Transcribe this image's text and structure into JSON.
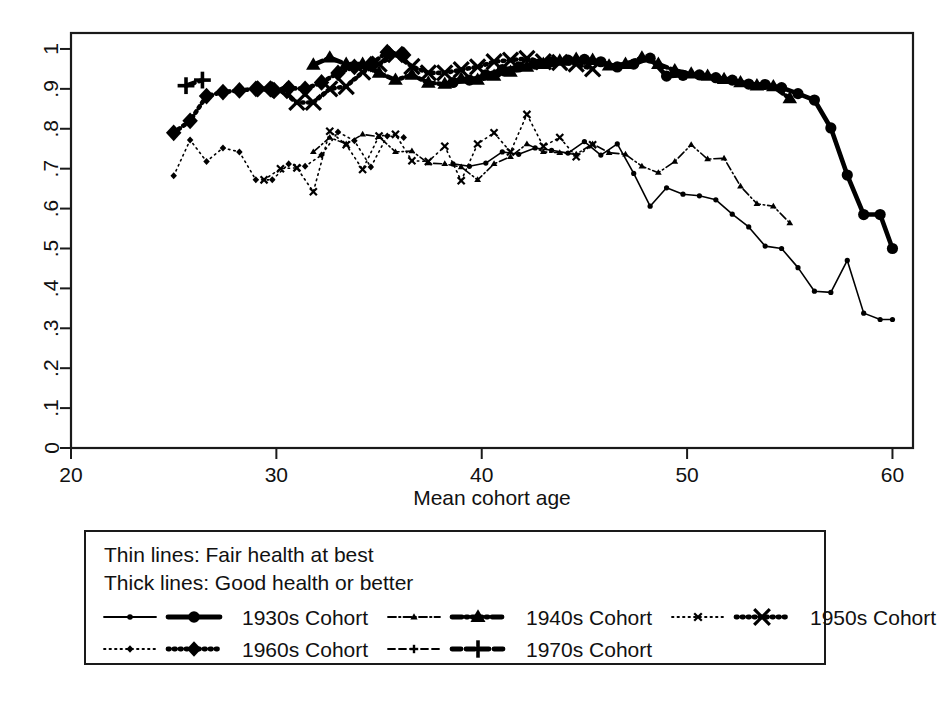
{
  "chart_data": {
    "type": "line",
    "title": "",
    "xlabel": "Mean cohort age",
    "ylabel": "",
    "xlim": [
      20,
      61
    ],
    "ylim": [
      0,
      1.04
    ],
    "xticks": [
      20,
      30,
      40,
      50,
      60
    ],
    "xticklabels": [
      "20",
      "30",
      "40",
      "50",
      "60"
    ],
    "yticks": [
      0,
      0.1,
      0.2,
      0.3,
      0.4,
      0.5,
      0.6,
      0.7,
      0.8,
      0.9,
      1
    ],
    "yticklabels": [
      "0",
      ".1",
      ".2",
      ".3",
      ".4",
      ".5",
      ".6",
      ".7",
      ".8",
      ".9",
      "1"
    ],
    "grid": false,
    "legend_position": "below-axes",
    "legend_notes": [
      "Thin lines: Fair health at best",
      "Thick lines: Good health or better"
    ],
    "series": [
      {
        "name": "1930s Cohort",
        "label": "1930s Cohort",
        "weight": "thick",
        "health": "Good health or better",
        "marker": "circle",
        "dash": "solid",
        "x": [
          38.6,
          39.4,
          40.2,
          41.0,
          41.8,
          42.6,
          43.4,
          44.2,
          45.0,
          45.8,
          46.6,
          47.4,
          48.2,
          49.0,
          49.8,
          50.6,
          51.4,
          52.2,
          53.0,
          53.8,
          54.6,
          55.4,
          56.2,
          57.0,
          57.8,
          58.6,
          59.4,
          60.0
        ],
        "y": [
          0.916,
          0.922,
          0.935,
          0.948,
          0.955,
          0.962,
          0.968,
          0.972,
          0.974,
          0.968,
          0.955,
          0.962,
          0.977,
          0.932,
          0.934,
          0.935,
          0.928,
          0.922,
          0.912,
          0.911,
          0.903,
          0.888,
          0.872,
          0.802,
          0.684,
          0.585,
          0.585,
          0.5
        ]
      },
      {
        "name": "1930s Cohort",
        "label": "1930s Cohort",
        "weight": "thin",
        "health": "Fair health at best",
        "marker": "circle",
        "dash": "solid",
        "x": [
          38.6,
          39.4,
          40.2,
          41.0,
          41.8,
          42.6,
          43.4,
          44.2,
          45.0,
          45.8,
          46.6,
          47.4,
          48.2,
          49.0,
          49.8,
          50.6,
          51.4,
          52.2,
          53.0,
          53.8,
          54.6,
          55.4,
          56.2,
          57.0,
          57.8,
          58.6,
          59.4,
          60.0
        ],
        "y": [
          0.712,
          0.706,
          0.714,
          0.742,
          0.736,
          0.752,
          0.746,
          0.739,
          0.768,
          0.734,
          0.762,
          0.688,
          0.606,
          0.652,
          0.636,
          0.632,
          0.622,
          0.586,
          0.554,
          0.506,
          0.5,
          0.452,
          0.393,
          0.39,
          0.47,
          0.338,
          0.322,
          0.322
        ]
      },
      {
        "name": "1940s Cohort",
        "label": "1940s Cohort",
        "weight": "thick",
        "health": "Good health or better",
        "marker": "triangle",
        "dash": "dashdot",
        "x": [
          31.8,
          32.6,
          33.4,
          34.2,
          35.0,
          35.8,
          36.6,
          37.4,
          38.2,
          39.0,
          39.8,
          40.6,
          41.4,
          42.2,
          43.0,
          43.8,
          44.6,
          45.4,
          46.2,
          47.0,
          47.8,
          48.6,
          49.4,
          50.2,
          51.0,
          51.8,
          52.6,
          53.4,
          54.2,
          55.0
        ],
        "y": [
          0.96,
          0.978,
          0.962,
          0.962,
          0.94,
          0.922,
          0.935,
          0.915,
          0.912,
          0.925,
          0.922,
          0.932,
          0.942,
          0.955,
          0.962,
          0.97,
          0.975,
          0.972,
          0.958,
          0.962,
          0.978,
          0.962,
          0.946,
          0.938,
          0.932,
          0.924,
          0.916,
          0.908,
          0.906,
          0.876
        ]
      },
      {
        "name": "1940s Cohort",
        "label": "1940s Cohort",
        "weight": "thin",
        "health": "Fair health at best",
        "marker": "triangle",
        "dash": "dashdot",
        "x": [
          31.8,
          32.6,
          33.4,
          34.2,
          35.0,
          35.8,
          36.6,
          37.4,
          38.2,
          39.0,
          39.8,
          40.6,
          41.4,
          42.2,
          43.0,
          43.8,
          44.6,
          45.4,
          46.2,
          47.0,
          47.8,
          48.6,
          49.4,
          50.2,
          51.0,
          51.8,
          52.6,
          53.4,
          54.2,
          55.0
        ],
        "y": [
          0.742,
          0.778,
          0.762,
          0.786,
          0.78,
          0.742,
          0.744,
          0.714,
          0.712,
          0.704,
          0.672,
          0.712,
          0.73,
          0.762,
          0.742,
          0.74,
          0.736,
          0.762,
          0.74,
          0.736,
          0.706,
          0.69,
          0.718,
          0.76,
          0.724,
          0.726,
          0.656,
          0.612,
          0.606,
          0.564
        ]
      },
      {
        "name": "1950s Cohort",
        "label": "1950s Cohort",
        "weight": "thick",
        "health": "Good health or better",
        "marker": "x",
        "dash": "dotted",
        "x": [
          29.4,
          30.2,
          31.0,
          31.8,
          32.6,
          33.4,
          34.2,
          35.0,
          35.8,
          36.6,
          37.4,
          38.2,
          39.0,
          39.8,
          40.6,
          41.4,
          42.2,
          43.0,
          43.8,
          44.6,
          45.4
        ],
        "y": [
          0.9,
          0.896,
          0.866,
          0.866,
          0.9,
          0.906,
          0.942,
          0.962,
          0.986,
          0.956,
          0.94,
          0.94,
          0.948,
          0.955,
          0.968,
          0.972,
          0.976,
          0.968,
          0.966,
          0.962,
          0.95
        ]
      },
      {
        "name": "1950s Cohort",
        "label": "1950s Cohort",
        "weight": "thin",
        "health": "Fair health at best",
        "marker": "x",
        "dash": "dotted",
        "x": [
          29.4,
          30.2,
          31.0,
          31.8,
          32.6,
          33.4,
          34.2,
          35.0,
          35.8,
          36.6,
          37.4,
          38.2,
          39.0,
          39.8,
          40.6,
          41.4,
          42.2,
          43.0,
          43.8,
          44.6,
          45.4
        ],
        "y": [
          0.672,
          0.7,
          0.702,
          0.642,
          0.794,
          0.76,
          0.698,
          0.782,
          0.786,
          0.72,
          0.718,
          0.756,
          0.67,
          0.762,
          0.79,
          0.742,
          0.836,
          0.756,
          0.778,
          0.73,
          0.76
        ]
      },
      {
        "name": "1960s Cohort",
        "label": "1960s Cohort",
        "weight": "thick",
        "health": "Good health or better",
        "marker": "diamond",
        "dash": "dotted",
        "x": [
          25.0,
          25.8,
          26.6,
          27.4,
          28.2,
          29.0,
          29.8,
          30.6,
          31.4,
          32.2,
          33.0,
          33.8,
          34.6,
          35.4,
          36.2
        ],
        "y": [
          0.79,
          0.82,
          0.882,
          0.892,
          0.896,
          0.9,
          0.898,
          0.902,
          0.9,
          0.916,
          0.94,
          0.955,
          0.962,
          0.992,
          0.985
        ]
      },
      {
        "name": "1960s Cohort",
        "label": "1960s Cohort",
        "weight": "thin",
        "health": "Fair health at best",
        "marker": "diamond",
        "dash": "dotted",
        "x": [
          25.0,
          25.8,
          26.6,
          27.4,
          28.2,
          29.0,
          29.8,
          30.6,
          31.4,
          32.2,
          33.0,
          33.8,
          34.6,
          35.4,
          36.2
        ],
        "y": [
          0.682,
          0.772,
          0.718,
          0.752,
          0.742,
          0.672,
          0.672,
          0.712,
          0.706,
          0.734,
          0.792,
          0.77,
          0.704,
          0.782,
          0.778
        ]
      },
      {
        "name": "1970s Cohort",
        "label": "1970s Cohort",
        "weight": "thick",
        "health": "Good health or better",
        "marker": "plus",
        "dash": "dashed",
        "x": [
          25.6,
          26.4
        ],
        "y": [
          0.908,
          0.922
        ]
      }
    ]
  },
  "axes": {
    "xlabel": "Mean cohort age",
    "xticklabels": [
      "20",
      "30",
      "40",
      "50",
      "60"
    ],
    "yticklabels": [
      "0",
      ".1",
      ".2",
      ".3",
      ".4",
      ".5",
      ".6",
      ".7",
      ".8",
      ".9",
      "1"
    ]
  },
  "legend": {
    "note_thin": "Thin lines: Fair health at best",
    "note_thick": "Thick lines: Good health or better",
    "entries": [
      {
        "label": "1930s Cohort",
        "marker": "circle",
        "dash": "solid"
      },
      {
        "label": "1940s Cohort",
        "marker": "triangle",
        "dash": "dashdot"
      },
      {
        "label": "1950s Cohort",
        "marker": "x",
        "dash": "dotted"
      },
      {
        "label": "1960s Cohort",
        "marker": "diamond",
        "dash": "dotted"
      },
      {
        "label": "1970s Cohort",
        "marker": "plus",
        "dash": "dashed"
      }
    ]
  },
  "colors": {
    "ink": "#000000",
    "frame": "#1a1a1a",
    "background": "#ffffff"
  }
}
